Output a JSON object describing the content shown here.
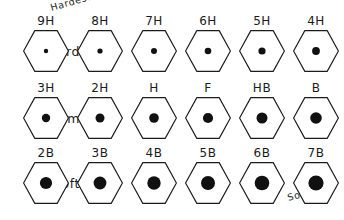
{
  "diagram": {
    "stroke_color": "#1b1b1b",
    "fill_color": "#ffffff",
    "dot_color": "#111111",
    "background": "#ffffff",
    "annotations": {
      "hardest": "Hardest",
      "softest": "Softest"
    },
    "rows": [
      {
        "label": "Hard",
        "cells": [
          {
            "grade": "9H",
            "dot_radius": 2.2
          },
          {
            "grade": "8H",
            "dot_radius": 2.6
          },
          {
            "grade": "7H",
            "dot_radius": 3.0
          },
          {
            "grade": "6H",
            "dot_radius": 3.3
          },
          {
            "grade": "5H",
            "dot_radius": 3.6
          },
          {
            "grade": "4H",
            "dot_radius": 3.9
          }
        ]
      },
      {
        "label": "Medium",
        "cells": [
          {
            "grade": "3H",
            "dot_radius": 4.2
          },
          {
            "grade": "2H",
            "dot_radius": 4.5
          },
          {
            "grade": "H",
            "dot_radius": 4.8
          },
          {
            "grade": "F",
            "dot_radius": 5.1
          },
          {
            "grade": "HB",
            "dot_radius": 5.5
          },
          {
            "grade": "B",
            "dot_radius": 5.8
          }
        ]
      },
      {
        "label": "Soft",
        "cells": [
          {
            "grade": "2B",
            "dot_radius": 6.1
          },
          {
            "grade": "3B",
            "dot_radius": 6.4
          },
          {
            "grade": "4B",
            "dot_radius": 6.7
          },
          {
            "grade": "5B",
            "dot_radius": 7.0
          },
          {
            "grade": "6B",
            "dot_radius": 7.3
          },
          {
            "grade": "7B",
            "dot_radius": 7.6
          }
        ]
      }
    ]
  }
}
